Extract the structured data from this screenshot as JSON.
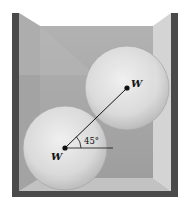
{
  "figure": {
    "upper_sphere": {
      "label": "W",
      "center": [
        127,
        88
      ],
      "radius": 42
    },
    "lower_sphere": {
      "label": "W",
      "center": [
        65,
        148
      ],
      "radius": 42
    },
    "angle_label": "45°",
    "angle_degrees": 45,
    "colors": {
      "wall": "#4a4a4a",
      "box_back": "#a9a9a9",
      "box_side_light": "#d4d4d4",
      "sphere_fill": "#e6e6e6",
      "line": "#111111"
    }
  }
}
